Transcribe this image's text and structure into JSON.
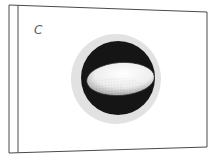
{
  "figure": {
    "panel_label": "C",
    "colors": {
      "background": "#ffffff",
      "frame_stroke": "#4a4a4a",
      "outer_ring": "#e2e2e2",
      "dark_disc": "#151515",
      "ellipse_fill": "#f4f4f4",
      "ellipse_shade": "#8a8a8a"
    }
  }
}
